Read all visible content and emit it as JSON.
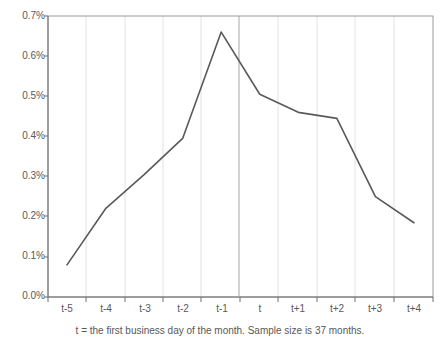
{
  "chart_data": {
    "type": "line",
    "title": "",
    "subtitle": "",
    "xlabel": "",
    "ylabel": "",
    "categories": [
      "t-5",
      "t-4",
      "t-3",
      "t-2",
      "t-1",
      "t",
      "t+1",
      "t+2",
      "t+3",
      "t+4"
    ],
    "values": [
      0.08,
      0.22,
      0.305,
      0.395,
      0.66,
      0.505,
      0.46,
      0.445,
      0.25,
      0.185
    ],
    "series": [
      {
        "name": "mean return",
        "values": [
          0.08,
          0.22,
          0.305,
          0.395,
          0.66,
          0.505,
          0.46,
          0.445,
          0.25,
          0.185
        ]
      }
    ],
    "ylim": [
      0.0,
      0.7
    ],
    "ytick_labels": [
      "0.0%",
      "0.1%",
      "0.2%",
      "0.3%",
      "0.4%",
      "0.5%",
      "0.6%",
      "0.7%"
    ],
    "ytick_values": [
      0.0,
      0.1,
      0.2,
      0.3,
      0.4,
      0.5,
      0.6,
      0.7
    ],
    "xtick_labels": [
      "t-5",
      "t-4",
      "t-3",
      "t-2",
      "t-1",
      "t",
      "t+1",
      "t+2",
      "t+3",
      "t+4"
    ],
    "grid": true,
    "legend": "none",
    "annotations": [
      {
        "type": "vertical-reference-line",
        "at_category": "t-1/t boundary",
        "label": ""
      }
    ],
    "caption": "t = the first business day of the month. Sample size is 37 months.",
    "line_color": "#595959",
    "grid_color": "#d9d9dd",
    "axis_color": "#808084",
    "reference_line_color": "#a6a6aa",
    "background_color": "#ffffff"
  },
  "caption": {
    "text": "t = the first business day of the month. Sample size is 37 months."
  },
  "axes": {
    "y": {
      "ticks": [
        {
          "label": "0.7%"
        },
        {
          "label": "0.6%"
        },
        {
          "label": "0.5%"
        },
        {
          "label": "0.4%"
        },
        {
          "label": "0.3%"
        },
        {
          "label": "0.2%"
        },
        {
          "label": "0.1%"
        },
        {
          "label": "0.0%"
        }
      ]
    },
    "x": {
      "ticks": [
        {
          "label": "t-5"
        },
        {
          "label": "t-4"
        },
        {
          "label": "t-3"
        },
        {
          "label": "t-2"
        },
        {
          "label": "t-1"
        },
        {
          "label": "t"
        },
        {
          "label": "t+1"
        },
        {
          "label": "t+2"
        },
        {
          "label": "t+3"
        },
        {
          "label": "t+4"
        }
      ]
    }
  },
  "title": {
    "text": ""
  }
}
